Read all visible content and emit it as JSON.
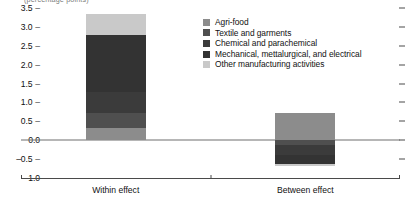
{
  "chart_data": {
    "type": "bar",
    "subtype": "stacked-bar-diverging",
    "title": "",
    "top_axis_label": "(percentage points)",
    "xlabel": "",
    "ylabel": "",
    "categories": [
      "Within effect",
      "Between effect"
    ],
    "ylim": [
      -1.0,
      3.5
    ],
    "ytick_labels": [
      "3.5",
      "3.0",
      "2.5",
      "2.0",
      "1.5",
      "1.0",
      "0.5",
      "0.0",
      "-0.5",
      "-1.0"
    ],
    "ytick_values": [
      3.5,
      3.0,
      2.5,
      2.0,
      1.5,
      1.0,
      0.5,
      0.0,
      -0.5,
      -1.0
    ],
    "ytick_step": 0.5,
    "grid": false,
    "zero_line": true,
    "right_axis_ticks": true,
    "legend_position": "top-center-right",
    "series": [
      {
        "name": "Agri-food",
        "color": "#8c8c8c",
        "values": [
          0.33,
          0.72
        ]
      },
      {
        "name": "Textile and garments",
        "color": "#4f4f4f",
        "values": [
          0.4,
          -0.13
        ]
      },
      {
        "name": "Chemical and parachemical",
        "color": "#3b3b3b",
        "values": [
          0.55,
          -0.25
        ]
      },
      {
        "name": "Mechanical, mettalurgical, and electrical",
        "color": "#333333",
        "values": [
          1.5,
          -0.24
        ]
      },
      {
        "name": "Other manufacturing activities",
        "color": "#c9c9c9",
        "values": [
          0.55,
          -0.06
        ]
      }
    ],
    "totals": [
      3.33,
      0.04
    ],
    "positive_totals": [
      3.33,
      0.72
    ],
    "negative_totals": [
      0.0,
      -0.68
    ]
  },
  "legend": {
    "items": [
      {
        "label": "Agri-food",
        "swatch": "#8c8c8c"
      },
      {
        "label": "Textile and garments",
        "swatch": "#4f4f4f"
      },
      {
        "label": "Chemical and parachemical",
        "swatch": "#3b3b3b"
      },
      {
        "label": "Mechanical, mettalurgical, and electrical",
        "swatch": "#333333"
      },
      {
        "label": "Other manufacturing activities",
        "swatch": "#c9c9c9"
      }
    ]
  },
  "axis": {
    "y_ticks": [
      {
        "label": "3.5"
      },
      {
        "label": "3.0"
      },
      {
        "label": "2.5"
      },
      {
        "label": "2.0"
      },
      {
        "label": "1.5"
      },
      {
        "label": "1.0"
      },
      {
        "label": "0.5"
      },
      {
        "label": "0.0"
      },
      {
        "label": "-0.5"
      },
      {
        "label": "-1.0"
      }
    ],
    "x_labels": [
      {
        "label": "Within effect"
      },
      {
        "label": "Between effect"
      }
    ]
  },
  "colors": {
    "axis": "#4a4a4a",
    "zero_line": "#6f6f6f",
    "text": "#111111",
    "background": "#ffffff"
  }
}
